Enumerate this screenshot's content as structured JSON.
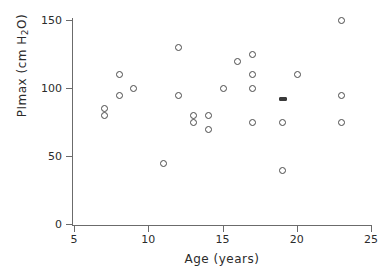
{
  "chart_data": {
    "type": "scatter",
    "title": "",
    "xlabel": "Age (years)",
    "ylabel_prefix": "PImax (cm H",
    "ylabel_sub": "2",
    "ylabel_suffix": "O)",
    "ylabel_plain": "PImax (cm H2O)",
    "xlim": [
      5,
      25
    ],
    "ylim": [
      0,
      155
    ],
    "xticks": [
      5,
      10,
      15,
      20,
      25
    ],
    "yticks": [
      0,
      50,
      100,
      150
    ],
    "xtick_labels": [
      "5",
      "10",
      "15",
      "20",
      "25"
    ],
    "ytick_labels": [
      "0",
      "50",
      "100",
      "150"
    ],
    "grid": false,
    "legend": null,
    "marker": "open-circle",
    "x": [
      7,
      7,
      8,
      8,
      9,
      11,
      12,
      12,
      13,
      13,
      14,
      14,
      15,
      16,
      17,
      17,
      17,
      17,
      19,
      19,
      19,
      20,
      23,
      23,
      23
    ],
    "y": [
      80,
      85,
      110,
      95,
      100,
      45,
      130,
      95,
      80,
      75,
      80,
      70,
      100,
      120,
      125,
      110,
      100,
      75,
      93,
      75,
      40,
      110,
      150,
      95,
      75
    ],
    "points": [
      {
        "x": 7,
        "y": 80,
        "style": "open"
      },
      {
        "x": 7,
        "y": 85,
        "style": "open"
      },
      {
        "x": 8,
        "y": 110,
        "style": "open"
      },
      {
        "x": 8,
        "y": 95,
        "style": "open"
      },
      {
        "x": 9,
        "y": 100,
        "style": "open"
      },
      {
        "x": 11,
        "y": 45,
        "style": "open"
      },
      {
        "x": 12,
        "y": 130,
        "style": "open"
      },
      {
        "x": 12,
        "y": 95,
        "style": "open"
      },
      {
        "x": 13,
        "y": 80,
        "style": "open"
      },
      {
        "x": 13,
        "y": 75,
        "style": "open"
      },
      {
        "x": 14,
        "y": 80,
        "style": "open"
      },
      {
        "x": 14,
        "y": 70,
        "style": "open"
      },
      {
        "x": 15,
        "y": 100,
        "style": "open"
      },
      {
        "x": 16,
        "y": 120,
        "style": "open"
      },
      {
        "x": 17,
        "y": 125,
        "style": "open"
      },
      {
        "x": 17,
        "y": 110,
        "style": "open"
      },
      {
        "x": 17,
        "y": 100,
        "style": "open"
      },
      {
        "x": 17,
        "y": 75,
        "style": "open"
      },
      {
        "x": 19,
        "y": 93,
        "style": "smudged"
      },
      {
        "x": 19,
        "y": 75,
        "style": "open"
      },
      {
        "x": 19,
        "y": 40,
        "style": "open"
      },
      {
        "x": 20,
        "y": 110,
        "style": "open"
      },
      {
        "x": 23,
        "y": 150,
        "style": "open"
      },
      {
        "x": 23,
        "y": 95,
        "style": "open"
      },
      {
        "x": 23,
        "y": 75,
        "style": "open"
      }
    ],
    "n_points": 25,
    "colors": {
      "axis": "#6b6b6b",
      "marker": "#4a4a4a",
      "text": "#2b2b2b",
      "background": "#ffffff"
    }
  },
  "geometry": {
    "x_pixel_at_xmin": 74,
    "x_pixel_at_xmax": 371,
    "y_pixel_at_ymin": 224,
    "y_pixel_at_ymax": 20,
    "ymax_value": 150,
    "ymin_value": 0,
    "xmin_value": 5,
    "xmax_value": 25
  }
}
